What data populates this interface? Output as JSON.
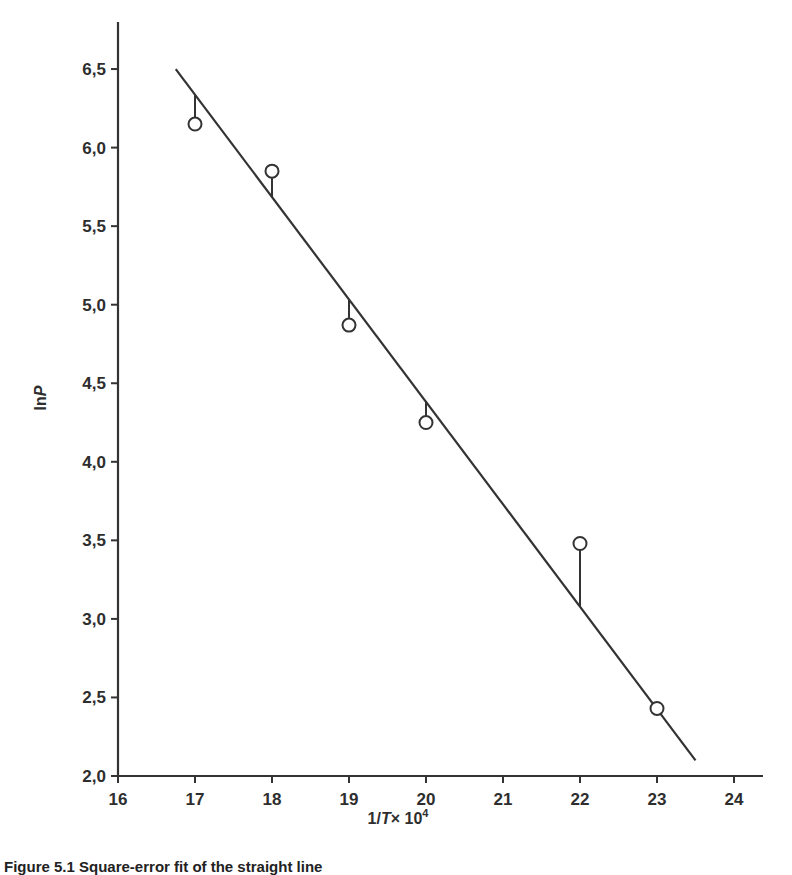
{
  "chart_data": {
    "type": "scatter",
    "title": "",
    "caption": "Figure 5.1 Square-error fit of the straight line",
    "xlabel": "1/T × 10⁴",
    "xlabel_parts": {
      "prefix": "1/",
      "var": "T",
      "mid": "× 10",
      "exp": "4"
    },
    "ylabel": "ln P",
    "ylabel_parts": {
      "prefix": "ln",
      "var": "P"
    },
    "xlim": [
      16,
      24.5
    ],
    "ylim": [
      2.0,
      6.8
    ],
    "x_ticks": [
      16,
      17,
      18,
      19,
      20,
      21,
      22,
      23,
      24
    ],
    "x_tick_labels": [
      "16",
      "17",
      "18",
      "19",
      "20",
      "21",
      "22",
      "23",
      "24"
    ],
    "y_ticks": [
      2.0,
      2.5,
      3.0,
      3.5,
      4.0,
      4.5,
      5.0,
      5.5,
      6.0,
      6.5
    ],
    "y_tick_labels": [
      "2,0",
      "2,5",
      "3,0",
      "3,5",
      "4,0",
      "4,5",
      "5,0",
      "5,5",
      "6,0",
      "6,5"
    ],
    "grid": false,
    "legend": null,
    "series": [
      {
        "name": "Observed points",
        "marker": "open-circle",
        "x": [
          17,
          18,
          19,
          20,
          22,
          23
        ],
        "y": [
          6.15,
          5.85,
          4.87,
          4.25,
          3.48,
          2.43
        ]
      },
      {
        "name": "Least-squares fit line",
        "style": "line",
        "x": [
          16.75,
          23.5
        ],
        "y": [
          6.5,
          2.1
        ]
      }
    ],
    "annotations": [
      {
        "type": "residual-segments",
        "description": "Vertical segments connecting each point to the fitted line"
      }
    ]
  }
}
